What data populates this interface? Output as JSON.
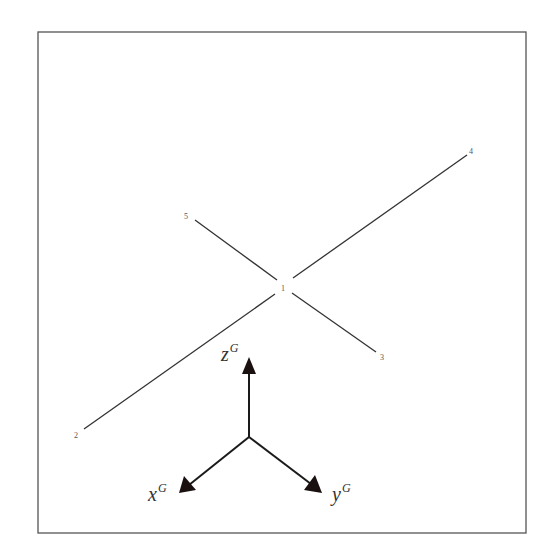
{
  "diagram": {
    "frame": {
      "x1": 38,
      "y1": 32,
      "x2": 526,
      "y2": 533,
      "stroke": "#555555"
    },
    "line_color": "#333333",
    "nodes": [
      {
        "id": "1",
        "label": "1",
        "x": 283,
        "y": 288
      },
      {
        "id": "2",
        "label": "2",
        "x": 77,
        "y": 436
      },
      {
        "id": "3",
        "label": "3",
        "x": 382,
        "y": 358
      },
      {
        "id": "4",
        "label": "4",
        "x": 472,
        "y": 153
      },
      {
        "id": "5",
        "label": "5",
        "x": 187,
        "y": 217
      }
    ],
    "members": [
      {
        "from": "1",
        "to": "2"
      },
      {
        "from": "1",
        "to": "3"
      },
      {
        "from": "1",
        "to": "4"
      },
      {
        "from": "1",
        "to": "5"
      }
    ],
    "global_axes": {
      "origin": {
        "x": 249,
        "y": 437
      },
      "z": {
        "label": "z",
        "superscript": "G"
      },
      "x": {
        "label": "x",
        "superscript": "G"
      },
      "y": {
        "label": "y",
        "superscript": "G"
      }
    }
  }
}
